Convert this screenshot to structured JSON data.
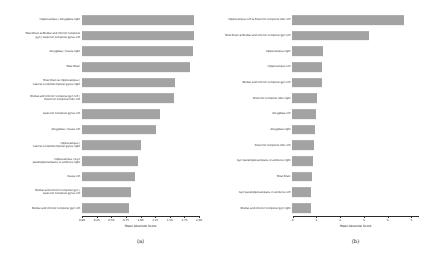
{
  "figure": {
    "background": "#ffffff",
    "bar_color": "#a3a3a3",
    "axis_color": "#2b2b2b"
  },
  "panels": [
    {
      "id": "panel-a",
      "subcaption": "(a)",
      "xlabel": "Mean Absolute Score",
      "xticks": [
        "0.00",
        "0.25",
        "0.50",
        "0.75",
        "1.00",
        "1.25",
        "1.50",
        "1.75",
        "2.00"
      ],
      "xlim": [
        0,
        2.0
      ],
      "categories": [
        "Hippocampus | Amygdala right",
        "Total Brain & Medial and inferior temporal\ngyri | Superior temporal gyrus left",
        "Amygdala | Insula right",
        "Total Brain",
        "Total Brain & Hippocampus |\nLateral occipitotemporal gyrus right",
        "Medial and inferior temporal gyri left |\nPosterior temporal lobe left",
        "Superior temporal gyrus left",
        "Amygdala | Insula left",
        "Hippocampus |\nLateral occipitotemporal gyrus right",
        "Hippocampus | Gyri\nparahippocampalis et ambiens right",
        "Insula left",
        "Medial and inferior temporal gyri |\nSuperior temporal gyrus left",
        "Medial and inferior temporal gyri left"
      ],
      "values": [
        1.93,
        1.92,
        1.9,
        1.86,
        1.6,
        1.58,
        1.34,
        1.28,
        1.02,
        0.97,
        0.92,
        0.84,
        0.81
      ]
    },
    {
      "id": "panel-b",
      "subcaption": "(b)",
      "xlabel": "Mean Absolute Score",
      "xticks": [
        "0",
        "1",
        "2",
        "3",
        "4",
        "5"
      ],
      "xlim": [
        0,
        5.3
      ],
      "categories": [
        "Hippocampus left & Posterior temporal lobe left",
        "Total Brain & Medial and inferior temporal gyri left",
        "Hippocampus right",
        "Hippocampus left",
        "Medial and inferior temporal gyri left",
        "Posterior temporal lobe right",
        "Amygdala left",
        "Amygdala right",
        "Posterior temporal lobe left",
        "Gyri parahippocampalis et ambiens right",
        "Total Brain",
        "Gyri parahippocampalis et ambiens left",
        "Medial and inferior temporal gyri right"
      ],
      "values": [
        4.7,
        3.25,
        1.3,
        1.26,
        1.24,
        1.04,
        1.02,
        0.96,
        0.92,
        0.86,
        0.82,
        0.8,
        0.78
      ]
    }
  ],
  "chart_data": [
    {
      "type": "bar",
      "orientation": "horizontal",
      "panel": "(a)",
      "title": "",
      "xlabel": "Mean Absolute Score",
      "ylabel": "",
      "xlim": [
        0,
        2.0
      ],
      "xticks": [
        0.0,
        0.25,
        0.5,
        0.75,
        1.0,
        1.25,
        1.5,
        1.75,
        2.0
      ],
      "grid": false,
      "legend": null,
      "bar_color": "#a3a3a3",
      "categories": [
        "Hippocampus | Amygdala right",
        "Total Brain & Medial and inferior temporal gyri | Superior temporal gyrus left",
        "Amygdala | Insula right",
        "Total Brain",
        "Total Brain & Hippocampus | Lateral occipitotemporal gyrus right",
        "Medial and inferior temporal gyri left | Posterior temporal lobe left",
        "Superior temporal gyrus left",
        "Amygdala | Insula left",
        "Hippocampus | Lateral occipitotemporal gyrus right",
        "Hippocampus | Gyri parahippocampalis et ambiens right",
        "Insula left",
        "Medial and inferior temporal gyri | Superior temporal gyrus left",
        "Medial and inferior temporal gyri left"
      ],
      "values": [
        1.93,
        1.92,
        1.9,
        1.86,
        1.6,
        1.58,
        1.34,
        1.28,
        1.02,
        0.97,
        0.92,
        0.84,
        0.81
      ]
    },
    {
      "type": "bar",
      "orientation": "horizontal",
      "panel": "(b)",
      "title": "",
      "xlabel": "Mean Absolute Score",
      "ylabel": "",
      "xlim": [
        0,
        5.3
      ],
      "xticks": [
        0,
        1,
        2,
        3,
        4,
        5
      ],
      "grid": false,
      "legend": null,
      "bar_color": "#a3a3a3",
      "categories": [
        "Hippocampus left & Posterior temporal lobe left",
        "Total Brain & Medial and inferior temporal gyri left",
        "Hippocampus right",
        "Hippocampus left",
        "Medial and inferior temporal gyri left",
        "Posterior temporal lobe right",
        "Amygdala left",
        "Amygdala right",
        "Posterior temporal lobe left",
        "Gyri parahippocampalis et ambiens right",
        "Total Brain",
        "Gyri parahippocampalis et ambiens left",
        "Medial and inferior temporal gyri right"
      ],
      "values": [
        4.7,
        3.25,
        1.3,
        1.26,
        1.24,
        1.04,
        1.02,
        0.96,
        0.92,
        0.86,
        0.82,
        0.8,
        0.78
      ]
    }
  ]
}
